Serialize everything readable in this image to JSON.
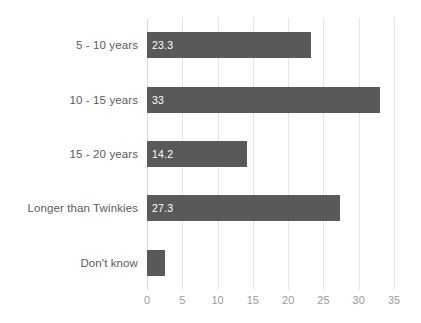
{
  "chart_data": {
    "type": "bar",
    "orientation": "horizontal",
    "title": "",
    "xlabel": "",
    "ylabel": "",
    "xlim": [
      0,
      35
    ],
    "xticks": [
      0,
      5,
      10,
      15,
      20,
      25,
      30,
      35
    ],
    "grid": true,
    "legend": false,
    "bar_color": "#595959",
    "label_color": "#5b5b5b",
    "tick_color": "#9a9a9a",
    "gridline_color": "#e4e4e6",
    "value_label_color": "#ffffff",
    "categories": [
      "5 - 10 years",
      "10 - 15 years",
      "15 - 20 years",
      "Longer than Twinkies",
      "Don't know"
    ],
    "values": [
      23.3,
      33,
      14.2,
      27.3,
      2.5
    ],
    "value_labels": [
      "23.3",
      "33",
      "14.2",
      "27.3",
      ""
    ]
  }
}
